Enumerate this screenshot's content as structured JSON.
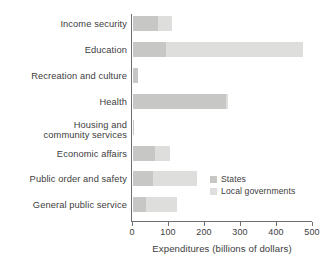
{
  "chart_data": {
    "type": "bar",
    "orientation": "horizontal",
    "stacked": true,
    "title": "",
    "xlabel": "Expenditures (billions of dollars)",
    "ylabel": "",
    "xlim": [
      0,
      500
    ],
    "xticks": [
      0,
      100,
      200,
      300,
      400,
      500
    ],
    "xtick_labels": [
      "0",
      "100",
      "200",
      "300",
      "400",
      "500"
    ],
    "grid": false,
    "legend_position": "center-right",
    "categories": [
      "Income security",
      "Education",
      "Recreation and culture",
      "Health",
      "Housing and\ncommunity services",
      "Economic affairs",
      "Public order and safety",
      "General public service"
    ],
    "series": [
      {
        "name": "States",
        "color": "#c7c7c6",
        "values": [
          70,
          92,
          14,
          258,
          4,
          62,
          56,
          36
        ]
      },
      {
        "name": "Local governments",
        "color": "#dededd",
        "values": [
          38,
          380,
          0,
          6,
          0,
          41,
          122,
          86
        ]
      }
    ],
    "totals": [
      108,
      472,
      14,
      264,
      4,
      103,
      178,
      122
    ]
  },
  "axis": {
    "x_title": "Expenditures (billions of dollars)",
    "ticks": [
      {
        "value": 0,
        "label": "0"
      },
      {
        "value": 100,
        "label": "100"
      },
      {
        "value": 200,
        "label": "200"
      },
      {
        "value": 300,
        "label": "300"
      },
      {
        "value": 400,
        "label": "400"
      },
      {
        "value": 500,
        "label": "500"
      }
    ]
  },
  "legend": {
    "items": [
      {
        "label": "States",
        "color": "#c7c7c6"
      },
      {
        "label": "Local governments",
        "color": "#dededd"
      }
    ]
  },
  "rows": [
    {
      "label": "Income security",
      "states": 70,
      "local": 38
    },
    {
      "label": "Education",
      "states": 92,
      "local": 380
    },
    {
      "label": "Recreation and culture",
      "states": 14,
      "local": 0
    },
    {
      "label": "Health",
      "states": 258,
      "local": 6
    },
    {
      "label": "Housing and community services",
      "label_line1": "Housing and",
      "label_line2": "community services",
      "states": 4,
      "local": 0
    },
    {
      "label": "Economic affairs",
      "states": 62,
      "local": 41
    },
    {
      "label": "Public order and safety",
      "states": 56,
      "local": 122
    },
    {
      "label": "General public service",
      "states": 36,
      "local": 86
    }
  ]
}
